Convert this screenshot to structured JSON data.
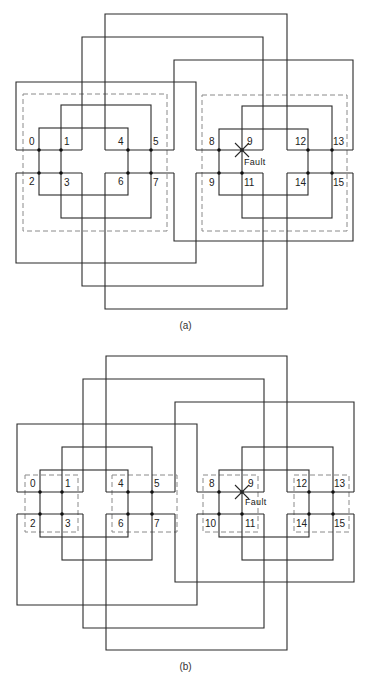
{
  "figure_a": {
    "caption": "(a)",
    "fault_label": "Fault",
    "node_labels": [
      "0",
      "1",
      "4",
      "5",
      "8",
      "9",
      "12",
      "13",
      "2",
      "3",
      "6",
      "7",
      "9",
      "11",
      "14",
      "15"
    ],
    "dashed_groups": "two large dashed boxes, one per 8-node cluster"
  },
  "figure_b": {
    "caption": "(b)",
    "fault_label": "Fault",
    "node_labels": [
      "0",
      "1",
      "4",
      "5",
      "8",
      "9",
      "12",
      "13",
      "2",
      "3",
      "6",
      "7",
      "10",
      "11",
      "14",
      "15"
    ],
    "dashed_groups": "four small dashed boxes, one per 4-node quad"
  },
  "colors": {
    "wire": "#2a2a2a",
    "dashed": "#8a8a8a",
    "background": "#ffffff"
  }
}
